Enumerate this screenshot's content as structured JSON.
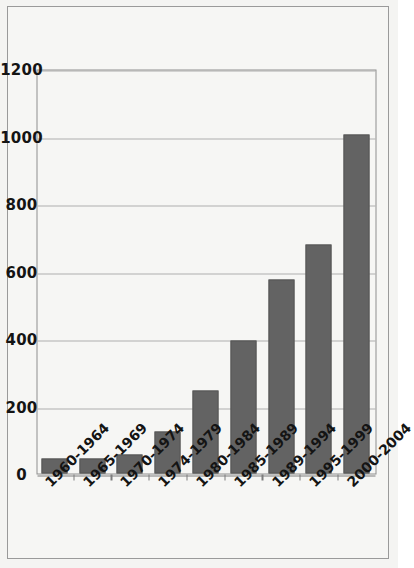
{
  "chart_data": {
    "type": "bar",
    "orientation": "horizontal",
    "title": "",
    "subtitle": "",
    "xlabel": "",
    "ylabel": "",
    "categories": [
      "1960-1964",
      "1965-1969",
      "1970-1974",
      "1974-1979",
      "1980-1984",
      "1985-1989",
      "1989-1994",
      "1995-1999",
      "2000-2004"
    ],
    "values": [
      45,
      45,
      55,
      125,
      245,
      395,
      575,
      680,
      1005
    ],
    "value_axis_ticks": [
      0,
      200,
      400,
      600,
      800,
      1000,
      1200
    ],
    "xlim": [
      0,
      1200
    ],
    "grid": true,
    "legend": false,
    "legend_position": "none",
    "series": [
      {
        "name": "",
        "values": [
          45,
          45,
          55,
          125,
          245,
          395,
          575,
          680,
          1005
        ]
      }
    ]
  },
  "style": {
    "bar_color": "#636363",
    "bar_border_color": "#575757",
    "plot_background": "#f6f6f4",
    "grid_color": "#adadad",
    "axis_color": "#7d7d7d",
    "frame_color": "#9a9a9a",
    "text_color": "#141414"
  }
}
